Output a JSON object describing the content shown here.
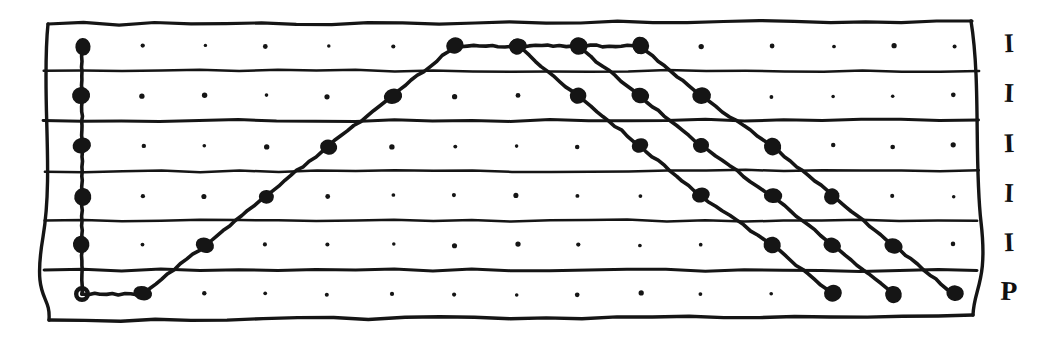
{
  "figure": {
    "kind": "hand-drawn-grid-plot",
    "title": "",
    "background_color": "#ffffff",
    "ink_color": "#151515",
    "frame": {
      "style": "hand-drawn-wobbly-rectangle",
      "left": 48,
      "top": 22,
      "right": 972,
      "bottom": 318
    },
    "grid": {
      "columns": 15,
      "rows": 6,
      "col_x": [
        82,
        143,
        205,
        266,
        328,
        393,
        455,
        517,
        578,
        640,
        701,
        772,
        833,
        893,
        954
      ],
      "row_y": [
        46,
        96,
        146,
        196,
        245,
        294
      ],
      "row_separator_y": [
        71,
        121,
        171,
        221,
        270
      ],
      "dot_radius_minor": 2.2,
      "dot_radius_major": 8.5
    },
    "lane_labels": [
      {
        "text": "I",
        "row": 0
      },
      {
        "text": "I",
        "row": 1
      },
      {
        "text": "I",
        "row": 2
      },
      {
        "text": "I",
        "row": 3
      },
      {
        "text": "I",
        "row": 4
      },
      {
        "text": "P",
        "row": 5
      }
    ],
    "origin_marker": {
      "type": "open-circle",
      "col": 0,
      "row": 5,
      "outer_radius": 8,
      "inner_radius": 3.6
    },
    "polylines": [
      {
        "name": "left-vertical-spine",
        "points": [
          [
            0,
            0
          ],
          [
            0,
            1
          ],
          [
            0,
            2
          ],
          [
            0,
            3
          ],
          [
            0,
            4
          ],
          [
            0,
            5
          ]
        ],
        "marker": "filled-dot"
      },
      {
        "name": "ramp-up-and-plateau",
        "points": [
          [
            0,
            5
          ],
          [
            1,
            5
          ],
          [
            2,
            4
          ],
          [
            3,
            3
          ],
          [
            4,
            2
          ],
          [
            5,
            1
          ],
          [
            6,
            0
          ],
          [
            7,
            0
          ],
          [
            8,
            0
          ],
          [
            9,
            0
          ]
        ],
        "marker": "filled-dot"
      },
      {
        "name": "descent-from-col7",
        "points": [
          [
            7,
            0
          ],
          [
            8,
            1
          ],
          [
            9,
            2
          ],
          [
            10,
            3
          ],
          [
            11,
            4
          ],
          [
            12,
            5
          ]
        ],
        "marker": "filled-dot"
      },
      {
        "name": "descent-from-col8",
        "points": [
          [
            8,
            0
          ],
          [
            9,
            1
          ],
          [
            10,
            2
          ],
          [
            11,
            3
          ],
          [
            12,
            4
          ],
          [
            13,
            5
          ]
        ],
        "marker": "filled-dot"
      },
      {
        "name": "descent-from-col9",
        "points": [
          [
            9,
            0
          ],
          [
            10,
            1
          ],
          [
            11,
            2
          ],
          [
            12,
            3
          ],
          [
            13,
            4
          ],
          [
            14,
            5
          ]
        ],
        "marker": "filled-dot"
      }
    ]
  },
  "chart_data": {
    "type": "line",
    "title": "",
    "xlabel": "",
    "ylabel": "",
    "x": [
      0,
      1,
      2,
      3,
      4,
      5,
      6,
      7,
      8,
      9,
      10,
      11,
      12,
      13,
      14
    ],
    "ylim": [
      0,
      5
    ],
    "xlim": [
      0,
      14
    ],
    "grid": true,
    "legend_position": "right-of-plot",
    "y_tick_labels": [
      "I",
      "I",
      "I",
      "I",
      "I",
      "P"
    ],
    "y_tick_values": [
      5,
      4,
      3,
      2,
      1,
      0
    ],
    "series": [
      {
        "name": "spine",
        "x": [
          0,
          0,
          0,
          0,
          0,
          0
        ],
        "values": [
          5,
          4,
          3,
          2,
          1,
          0
        ]
      },
      {
        "name": "ramp-up-and-plateau",
        "x": [
          0,
          1,
          2,
          3,
          4,
          5,
          6,
          7,
          8,
          9
        ],
        "values": [
          0,
          0,
          1,
          2,
          3,
          4,
          5,
          5,
          5,
          5
        ]
      },
      {
        "name": "descent-from-col7",
        "x": [
          7,
          8,
          9,
          10,
          11,
          12
        ],
        "values": [
          5,
          4,
          3,
          2,
          1,
          0
        ]
      },
      {
        "name": "descent-from-col8",
        "x": [
          8,
          9,
          10,
          11,
          12,
          13
        ],
        "values": [
          5,
          4,
          3,
          2,
          1,
          0
        ]
      },
      {
        "name": "descent-from-col9",
        "x": [
          9,
          10,
          11,
          12,
          13,
          14
        ],
        "values": [
          5,
          4,
          3,
          2,
          1,
          0
        ]
      }
    ]
  }
}
